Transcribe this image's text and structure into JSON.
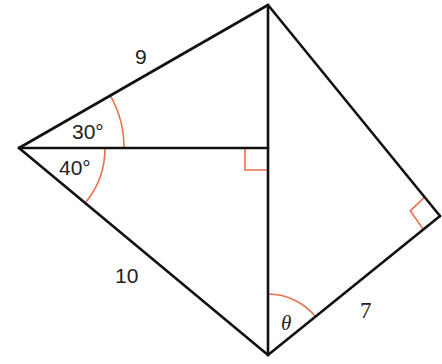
{
  "diagram": {
    "title": "",
    "colors": {
      "edge": "#111111",
      "angle_mark": "#e8704f",
      "text": "#222222",
      "background": "#ffffff"
    },
    "vertices": {
      "left": {
        "x": 19,
        "y": 148
      },
      "top": {
        "x": 268,
        "y": 5
      },
      "foot": {
        "x": 268,
        "y": 148
      },
      "bottom": {
        "x": 268,
        "y": 355
      },
      "right": {
        "x": 440,
        "y": 216
      }
    },
    "labels": {
      "side_top": "9",
      "side_bottom": "10",
      "side_right": "7",
      "angle_upper": "30°",
      "angle_lower": "40°",
      "angle_theta": "θ"
    },
    "angle_marks": [
      {
        "name": "angle-30",
        "vertex": "left",
        "value": "30°"
      },
      {
        "name": "angle-40",
        "vertex": "left",
        "value": "40°"
      },
      {
        "name": "angle-theta",
        "vertex": "bottom",
        "value": "θ"
      }
    ],
    "right_angles": [
      {
        "name": "right-angle-foot",
        "vertex": "foot"
      },
      {
        "name": "right-angle-right",
        "vertex": "right"
      }
    ]
  }
}
